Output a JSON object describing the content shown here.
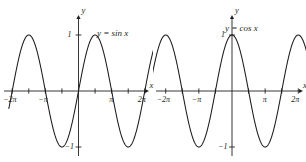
{
  "figure": {
    "width": 306,
    "height": 162,
    "background_color": "#ffffff",
    "curve_color": "#1c1a1b",
    "axis_color": "#231f20"
  },
  "panels": [
    {
      "id": "sin",
      "equation_label": "y = sin x",
      "y_axis_label": "y",
      "x_axis_label": "x",
      "y_tick_top_label": "1",
      "y_tick_bottom_label": "−1",
      "x_tick_labels": [
        "−2π",
        "−π",
        "π",
        "2π"
      ]
    },
    {
      "id": "cos",
      "equation_label": "y = cos x",
      "y_axis_label": "y",
      "x_axis_label": "x",
      "y_tick_top_label": "1",
      "y_tick_bottom_label": "−1",
      "x_tick_labels": [
        "−2π",
        "−π",
        "π",
        "2π"
      ]
    }
  ],
  "chart_data": [
    {
      "type": "line",
      "title": "",
      "series": [
        {
          "name": "y = sin x",
          "function": "sin"
        }
      ],
      "xlabel": "x",
      "ylabel": "y",
      "xlim": [
        -6.283185307179586,
        6.283185307179586
      ],
      "ylim": [
        -1,
        1
      ],
      "x_ticks": [
        -6.283185307179586,
        -4.71238898038469,
        -3.141592653589793,
        -1.5707963267948966,
        1.5707963267948966,
        3.141592653589793,
        4.71238898038469,
        6.283185307179586
      ],
      "x_tick_labels": [
        "−2π",
        "",
        "−π",
        "",
        "",
        "π",
        "",
        "2π"
      ],
      "y_ticks": [
        -1,
        1
      ],
      "y_tick_labels": [
        "−1",
        "1"
      ],
      "grid": false,
      "legend": "none",
      "annotations": [
        "y = sin x"
      ],
      "key_points": [
        {
          "x": -6.283185307179586,
          "y": 0
        },
        {
          "x": -4.71238898038469,
          "y": 1
        },
        {
          "x": -3.141592653589793,
          "y": 0
        },
        {
          "x": -1.5707963267948966,
          "y": -1
        },
        {
          "x": 0,
          "y": 0
        },
        {
          "x": 1.5707963267948966,
          "y": 1
        },
        {
          "x": 3.141592653589793,
          "y": 0
        },
        {
          "x": 4.71238898038469,
          "y": -1
        },
        {
          "x": 6.283185307179586,
          "y": 0
        }
      ]
    },
    {
      "type": "line",
      "title": "",
      "series": [
        {
          "name": "y = cos x",
          "function": "cos"
        }
      ],
      "xlabel": "x",
      "ylabel": "y",
      "xlim": [
        -6.283185307179586,
        6.283185307179586
      ],
      "ylim": [
        -1,
        1
      ],
      "x_ticks": [
        -6.283185307179586,
        -4.71238898038469,
        -3.141592653589793,
        -1.5707963267948966,
        1.5707963267948966,
        3.141592653589793,
        4.71238898038469,
        6.283185307179586
      ],
      "x_tick_labels": [
        "−2π",
        "",
        "−π",
        "",
        "",
        "π",
        "",
        "2π"
      ],
      "y_ticks": [
        -1,
        1
      ],
      "y_tick_labels": [
        "−1",
        "1"
      ],
      "grid": false,
      "legend": "none",
      "annotations": [
        "y = cos x"
      ],
      "key_points": [
        {
          "x": -6.283185307179586,
          "y": 1
        },
        {
          "x": -4.71238898038469,
          "y": 0
        },
        {
          "x": -3.141592653589793,
          "y": -1
        },
        {
          "x": -1.5707963267948966,
          "y": 0
        },
        {
          "x": 0,
          "y": 1
        },
        {
          "x": 1.5707963267948966,
          "y": 0
        },
        {
          "x": 3.141592653589793,
          "y": -1
        },
        {
          "x": 4.71238898038469,
          "y": 0
        },
        {
          "x": 6.283185307179586,
          "y": 1
        }
      ]
    }
  ]
}
